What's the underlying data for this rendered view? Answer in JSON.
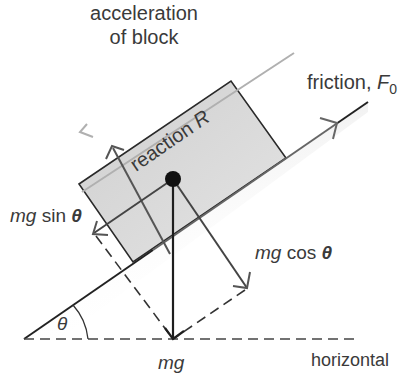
{
  "diagram": {
    "title_lines": [
      "acceleration",
      "of block"
    ],
    "labels": {
      "friction_text": "friction, ",
      "friction_symbol": "F",
      "friction_subscript": "0",
      "reaction_text": "reaction ",
      "reaction_symbol": "R",
      "mg_sin_mg": "mg",
      "mg_sin_fn": " sin ",
      "mg_sin_theta": "θ",
      "mg_cos_mg": "mg",
      "mg_cos_fn": " cos ",
      "mg_cos_theta": "θ",
      "mg": "mg",
      "horizontal": "horizontal",
      "angle": "θ"
    },
    "colors": {
      "block_fill": "#d9d9d9",
      "line_dark": "#222222",
      "arrow_grey": "#555555",
      "accel_arrow": "#b0b0b0",
      "text": "#3a3a3a"
    }
  }
}
